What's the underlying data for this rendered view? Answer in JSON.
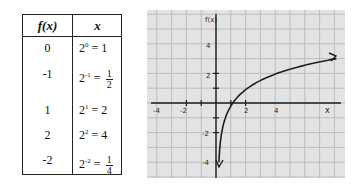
{
  "table": {
    "headers": {
      "fx": "f(x)",
      "x": "x"
    },
    "rows": [
      {
        "fx": "0",
        "base": "2",
        "exp": "0",
        "eq": " = ",
        "val": "1",
        "frac": false
      },
      {
        "fx": "-1",
        "base": "2",
        "exp": "-1",
        "eq": " = ",
        "num": "1",
        "den": "2",
        "frac": true
      },
      {
        "fx": "1",
        "base": "2",
        "exp": "1",
        "eq": " = ",
        "val": "2",
        "frac": false
      },
      {
        "fx": "2",
        "base": "2",
        "exp": "2",
        "eq": " = ",
        "val": "4",
        "frac": false
      },
      {
        "fx": "-2",
        "base": "2",
        "exp": "-2",
        "eq": " = ",
        "num": "1",
        "den": "4",
        "frac": true
      }
    ]
  },
  "graph": {
    "y_axis_label": "f(x)",
    "x_axis_label": "x",
    "x_ticks": [
      "-4",
      "-2",
      "2",
      "4"
    ],
    "y_ticks": [
      "4",
      "2",
      "-2",
      "-4"
    ],
    "colors": {
      "paper": "#e3e3e3",
      "grid": "#bdbdbd",
      "ink": "#1e1e1e"
    }
  },
  "chart_data": {
    "type": "line",
    "title": "",
    "xlabel": "x",
    "ylabel": "f(x)",
    "function": "f(x) = log2(x)",
    "series": [
      {
        "name": "f(x) = log2(x)",
        "x": [
          0.0625,
          0.25,
          0.5,
          1,
          2,
          4,
          8
        ],
        "y": [
          -4,
          -2,
          -1,
          0,
          1,
          2,
          3
        ]
      }
    ],
    "table_points": [
      {
        "x": 1,
        "fx": 0
      },
      {
        "x": 0.5,
        "fx": -1
      },
      {
        "x": 2,
        "fx": 1
      },
      {
        "x": 4,
        "fx": 2
      },
      {
        "x": 0.25,
        "fx": -2
      }
    ],
    "xlim": [
      -4,
      8
    ],
    "ylim": [
      -4,
      5
    ],
    "x_ticks": [
      -4,
      -2,
      2,
      4
    ],
    "y_ticks": [
      -4,
      -2,
      2,
      4
    ],
    "grid": true
  }
}
